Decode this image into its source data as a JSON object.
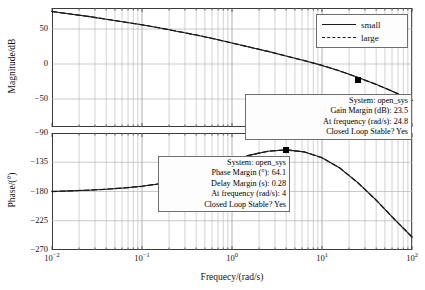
{
  "axes": {
    "magnitude_label": "Magnitude/dB",
    "phase_label": "Phase/(°)",
    "frequency_label": "Frequecy/(rad/s)",
    "magnitude_ticks": [
      "50",
      "0",
      "−50"
    ],
    "phase_ticks": [
      "−90",
      "−135",
      "−180",
      "−225",
      "−270"
    ],
    "x_ticks": [
      {
        "mantissa": "10",
        "exponent": "-2"
      },
      {
        "mantissa": "10",
        "exponent": "-1"
      },
      {
        "mantissa": "10",
        "exponent": "0"
      },
      {
        "mantissa": "10",
        "exponent": "1"
      },
      {
        "mantissa": "10",
        "exponent": "2"
      }
    ]
  },
  "legend": {
    "items": [
      {
        "label": "small",
        "style": "solid"
      },
      {
        "label": "large",
        "style": "dashed"
      }
    ]
  },
  "gain_tooltip": {
    "line1": "System: open_sys",
    "line2": "Gain Margin (dB): 23.5",
    "line3": "At frequency (rad/s): 24.8",
    "line4": "Closed Loop Stable? Yes"
  },
  "phase_tooltip": {
    "line1": "System: open_sys",
    "line2": "Phase Margin (°): 64.1",
    "line3": "Delay Margin (s): 0.28",
    "line4": "At frequency (rad/s): 4",
    "line5": "Closed Loop Stable? Yes"
  },
  "chart_data": {
    "type": "line",
    "title": "",
    "subplots": [
      {
        "name": "magnitude",
        "ylabel": "Magnitude/dB",
        "xlabel": "",
        "xlim": [
          0.01,
          100
        ],
        "ylim": [
          -90,
          80
        ],
        "xscale": "log",
        "yticks": [
          50,
          0,
          -50
        ],
        "grid": true,
        "series": [
          {
            "name": "small",
            "style": "solid",
            "x": [
              0.01,
              0.0158,
              0.0251,
              0.0398,
              0.0631,
              0.1,
              0.158,
              0.251,
              0.398,
              0.631,
              1,
              1.58,
              2.51,
              3.98,
              6.31,
              10,
              15.8,
              24.8,
              39.8,
              63.1,
              100
            ],
            "y": [
              75,
              71.5,
              68,
              64,
              60,
              56,
              51.5,
              46.5,
              41.5,
              36,
              30,
              24,
              18,
              11.5,
              5,
              -2,
              -10,
              -19,
              -29,
              -40,
              -52
            ]
          },
          {
            "name": "large",
            "style": "dashed",
            "x": [
              0.01,
              0.0158,
              0.0251,
              0.0398,
              0.0631,
              0.1,
              0.158,
              0.251,
              0.398,
              0.631,
              1,
              1.58,
              2.51,
              3.98,
              6.31,
              10,
              15.8,
              24.8,
              39.8,
              63.1,
              100
            ],
            "y": [
              75,
              71.5,
              68,
              64,
              60,
              56,
              51.5,
              46.5,
              41.5,
              36,
              30,
              24,
              18,
              11.5,
              5,
              -2,
              -10,
              -19,
              -29,
              -40,
              -52
            ]
          }
        ],
        "markers": [
          {
            "x": 24.8,
            "y": -23.5,
            "label": "gain-margin-marker"
          }
        ]
      },
      {
        "name": "phase",
        "ylabel": "Phase/(°)",
        "xlabel": "Frequecy/(rad/s)",
        "xlim": [
          0.01,
          100
        ],
        "ylim": [
          -270,
          -90
        ],
        "xscale": "log",
        "yticks": [
          -90,
          -135,
          -180,
          -225,
          -270
        ],
        "grid": true,
        "series": [
          {
            "name": "small",
            "style": "solid",
            "x": [
              0.01,
              0.0158,
              0.0251,
              0.0398,
              0.0631,
              0.1,
              0.158,
              0.251,
              0.398,
              0.631,
              1,
              1.58,
              2.51,
              4,
              6.31,
              10,
              15.8,
              24.8,
              39.8,
              63.1,
              100
            ],
            "y": [
              -180,
              -179,
              -178,
              -176.5,
              -174.5,
              -172,
              -168,
              -162,
              -154,
              -144,
              -133,
              -124,
              -118,
              -116,
              -119,
              -128,
              -144,
              -166,
              -193,
              -222,
              -250
            ]
          },
          {
            "name": "large",
            "style": "dashed",
            "x": [
              0.01,
              0.0158,
              0.0251,
              0.0398,
              0.0631,
              0.1,
              0.158,
              0.251,
              0.398,
              0.631,
              1,
              1.58,
              2.51,
              4,
              6.31,
              10,
              15.8,
              24.8,
              39.8,
              63.1,
              100
            ],
            "y": [
              -180,
              -179,
              -178,
              -176.5,
              -174.5,
              -172,
              -168,
              -162,
              -154,
              -144,
              -133,
              -124,
              -118,
              -116,
              -119,
              -128,
              -144,
              -166,
              -193,
              -222,
              -250
            ]
          }
        ],
        "markers": [
          {
            "x": 4,
            "y": -116,
            "label": "phase-margin-marker"
          }
        ]
      }
    ]
  }
}
